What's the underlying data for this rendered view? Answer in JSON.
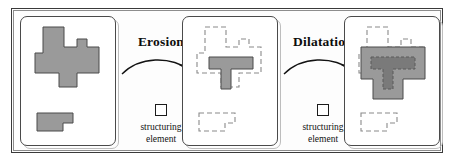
{
  "figure": {
    "background": "#ffffff",
    "frame_color": "#3a3a3a"
  },
  "colors": {
    "shape_fill": "#9a9a9a",
    "shape_stroke": "#4a4a4a",
    "inner_fill": "#7a7a7a",
    "dashed_outline": "#8a8a8a",
    "text": "#0d0d0d",
    "panel_border": "#4a4a4a"
  },
  "operations": [
    {
      "id": "erosion",
      "label": "Erosion",
      "arrow": "curved-arrow-right",
      "structuring_element": {
        "icon": "square-icon",
        "label_line_1": "structuring",
        "label_line_2": "element"
      }
    },
    {
      "id": "dilatation",
      "label": "Dilatation",
      "arrow": "curved-arrow-right",
      "structuring_element": {
        "icon": "square-icon",
        "label_line_1": "structuring",
        "label_line_2": "element"
      }
    }
  ],
  "panels": [
    {
      "id": "original",
      "name": "original-set",
      "shapes": [
        {
          "name": "main-polygon",
          "style": "filled",
          "points": "22,10 43,10 43,30 56,30 56,22 66,22 66,30 78,30 78,56 56,56 56,70 38,70 38,56 14,56 14,36 22,36"
        },
        {
          "name": "small-polygon",
          "style": "filled",
          "points": "16,96 52,96 52,106 42,106 42,114 16,114"
        }
      ]
    },
    {
      "id": "eroded",
      "name": "eroded-set",
      "shapes": [
        {
          "name": "original-outline",
          "style": "dashed",
          "points": "22,10 43,10 43,30 56,30 56,22 66,22 66,30 78,30 78,56 56,56 56,70 38,70 38,56 14,56 14,36 22,36"
        },
        {
          "name": "small-outline",
          "style": "dashed",
          "points": "16,96 52,96 52,106 42,106 42,114 16,114"
        },
        {
          "name": "erosion-result",
          "style": "filled",
          "points": "26,40 70,40 70,52 48,52 48,72 38,72 38,52 26,52"
        }
      ]
    },
    {
      "id": "opened",
      "name": "opened-set",
      "shapes": [
        {
          "name": "original-outline",
          "style": "dashed",
          "points": "22,10 43,10 43,30 56,30 56,22 66,22 66,30 78,30 78,56 56,56 56,70 38,70 38,56 14,56 14,36 22,36"
        },
        {
          "name": "small-outline",
          "style": "dashed",
          "points": "16,96 52,96 52,106 42,106 42,114 16,114"
        },
        {
          "name": "dilatation-result",
          "style": "filled",
          "points": "16,30 80,30 80,62 58,62 58,82 28,82 28,62 16,62"
        },
        {
          "name": "erosion-core",
          "style": "inner",
          "points": "26,40 70,40 70,52 48,52 48,72 38,72 38,52 26,52"
        }
      ]
    }
  ]
}
